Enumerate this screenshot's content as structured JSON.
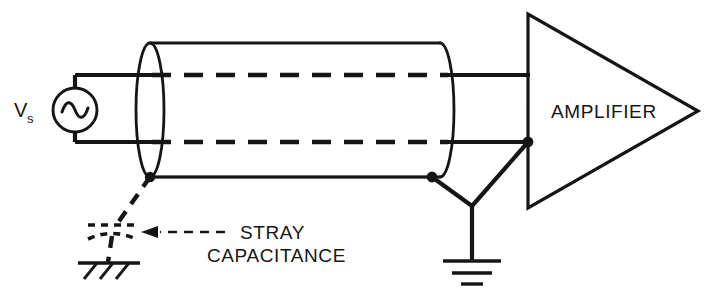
{
  "figure": {
    "type": "schematic-diagram",
    "background_color": "#ffffff",
    "ink_color": "#151515"
  },
  "labels": {
    "source_symbol": "V",
    "source_subscript": "s",
    "amplifier": "AMPLIFIER",
    "stray_line1": "STRAY",
    "stray_line2": "CAPACITANCE"
  },
  "components": {
    "source": {
      "name": "ac-voltage-source",
      "symbol": "sine-wave-in-circle",
      "label": "Vs"
    },
    "cable": {
      "name": "shielded-cable",
      "representation": "cylinder-with-end-ellipse",
      "inner_conductors": 2,
      "inner_conductor_style": "dashed"
    },
    "amplifier": {
      "name": "amplifier",
      "shape": "triangle",
      "inputs": 2
    },
    "stray_capacitor": {
      "name": "stray-capacitance",
      "style": "dashed-capacitor",
      "connects": "cable-shield-to-chassis-ground"
    },
    "chassis_ground": {
      "name": "chassis-ground",
      "style": "hatched"
    },
    "earth_ground": {
      "name": "earth-ground",
      "style": "three-bar"
    }
  },
  "annotations": {
    "stray_arrow": {
      "name": "stray-capacitance-pointer",
      "style": "dashed-arrow",
      "direction": "left"
    }
  }
}
